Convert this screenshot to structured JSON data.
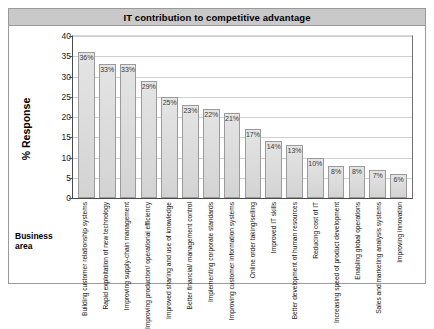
{
  "chart_data": {
    "type": "bar",
    "title": "IT contribution to competitive advantage",
    "xlabel": "Business area",
    "ylabel": "% Response",
    "ylim": [
      0,
      40
    ],
    "yticks": [
      40,
      35,
      30,
      25,
      20,
      15,
      10,
      5,
      0
    ],
    "grid": true,
    "legend": "none",
    "value_suffix": "%",
    "categories": [
      "Building customer relationship systems",
      "Rapid exploitation of new technology",
      "Improving supply-chain management",
      "Improving production/ operational efficiency",
      "Improved sharing and use of knowledge",
      "Better financial/ management control",
      "Implementing corporate standards",
      "Improving customer information systems",
      "Online order taking/selling",
      "Improved IT skills",
      "Better development of human resources",
      "Reducing cost of IT",
      "Increasing speed of product development",
      "Enabling global operations",
      "Sales and marketing analysis systems",
      "Improving innovation"
    ],
    "values": [
      36,
      33,
      33,
      29,
      25,
      23,
      22,
      21,
      17,
      14,
      13,
      10,
      8,
      8,
      7,
      6
    ],
    "labels": [
      "36%",
      "33%",
      "33%",
      "29%",
      "25%",
      "23%",
      "22%",
      "21%",
      "17%",
      "14%",
      "13%",
      "10%",
      "8%",
      "8%",
      "7%",
      "6%"
    ]
  },
  "colors": {
    "title_band": "#c9c9c9",
    "bar_fill": "#dcdcdc",
    "bar_border": "#9b9b9b",
    "gridline": "#d0d0d0",
    "axis": "#4a4a4a"
  }
}
